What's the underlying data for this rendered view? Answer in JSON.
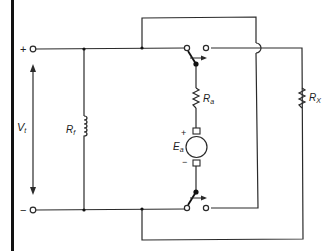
{
  "diagram": {
    "type": "circuit-schematic",
    "colors": {
      "line": "#2a2a2a",
      "background": "#ffffff",
      "border_bar": "#111111"
    },
    "terminals": {
      "positive": {
        "sign": "+"
      },
      "negative": {
        "sign": "−"
      }
    },
    "labels": {
      "terminal_voltage": {
        "main": "V",
        "sub": "t"
      },
      "field_resistance": {
        "main": "R",
        "sub": "f"
      },
      "armature_resistance": {
        "main": "R",
        "sub": "a"
      },
      "external_resistance": {
        "main": "R",
        "sub": "X"
      },
      "generated_emf": {
        "main": "E",
        "sub": "a"
      },
      "emf_plus": "+",
      "emf_minus": "−"
    },
    "components": [
      {
        "id": "Rf",
        "kind": "field-winding-inductor"
      },
      {
        "id": "Ra",
        "kind": "resistor"
      },
      {
        "id": "Ea",
        "kind": "dc-generator-armature"
      },
      {
        "id": "Rx",
        "kind": "resistor"
      },
      {
        "id": "S1",
        "kind": "spdt-switch-top"
      },
      {
        "id": "S2",
        "kind": "spdt-switch-bottom"
      }
    ]
  }
}
